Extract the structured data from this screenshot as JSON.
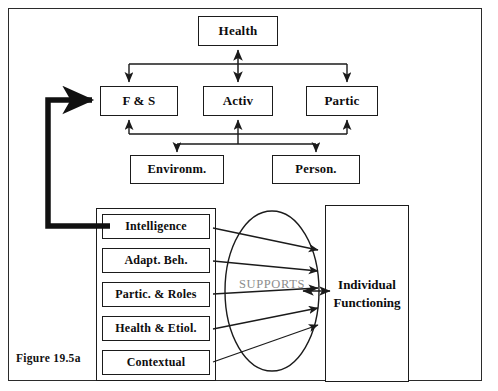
{
  "figure": {
    "caption": "Figure 19.5a",
    "supports_label": "SUPPORTS"
  },
  "icf_model": {
    "health": {
      "label": "Health"
    },
    "row_components": [
      {
        "id": "fs",
        "label": "F & S"
      },
      {
        "id": "activ",
        "label": "Activ"
      },
      {
        "id": "partic",
        "label": "Partic"
      }
    ],
    "contextual_factors": [
      {
        "id": "environm",
        "label": "Environm."
      },
      {
        "id": "person",
        "label": "Person."
      }
    ]
  },
  "dimensions_panel": {
    "items": [
      {
        "id": "intelligence",
        "label": "Intelligence"
      },
      {
        "id": "adapt-beh",
        "label": "Adapt. Beh."
      },
      {
        "id": "partic-roles",
        "label": "Partic. & Roles"
      },
      {
        "id": "health-etiol",
        "label": "Health & Etiol."
      },
      {
        "id": "contextual",
        "label": "Contextual"
      }
    ]
  },
  "outcome": {
    "line1": "Individual",
    "line2": "Functioning"
  },
  "colors": {
    "stroke": "#1b1b1b",
    "frame": "#2b2b2b",
    "supports_text": "#8d8d8d",
    "background": "#ffffff"
  }
}
